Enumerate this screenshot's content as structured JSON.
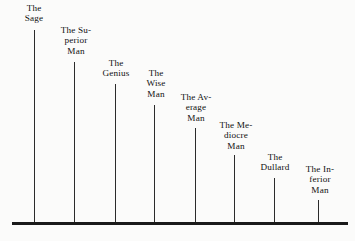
{
  "chart_data": {
    "type": "bar",
    "title": "",
    "subtitle": "",
    "xlabel": "",
    "ylabel": "",
    "grid": false,
    "legend": null,
    "axis": {
      "baseline_visible": true,
      "y_axis_visible": false,
      "tick_labels": [],
      "ylim": [
        0,
        100
      ]
    },
    "categories": [
      "The Sage",
      "The Superior Man",
      "The Genius",
      "The Wise Man",
      "The Average Man",
      "The Mediocre Man",
      "The Dullard",
      "The Inferior Man"
    ],
    "values": [
      100,
      84,
      72,
      61,
      49,
      35,
      23,
      12
    ],
    "annotations": []
  },
  "bars": [
    {
      "label_lines": [
        "The",
        "Sage"
      ],
      "name": "sage",
      "x": 34,
      "top": 30,
      "label_x": 34,
      "label_y": 3,
      "value": 100
    },
    {
      "label_lines": [
        "The Su-",
        "perior",
        "Man"
      ],
      "name": "superior-man",
      "x": 74,
      "top": 62,
      "label_x": 76,
      "label_y": 25,
      "value": 84
    },
    {
      "label_lines": [
        "The",
        "Genius"
      ],
      "name": "genius",
      "x": 115,
      "top": 84,
      "label_x": 116,
      "label_y": 58,
      "value": 72
    },
    {
      "label_lines": [
        "The",
        "Wise",
        "Man"
      ],
      "name": "wise-man",
      "x": 154,
      "top": 105,
      "label_x": 156,
      "label_y": 68,
      "value": 61
    },
    {
      "label_lines": [
        "The Av-",
        "erage",
        "Man"
      ],
      "name": "average-man",
      "x": 195,
      "top": 128,
      "label_x": 196,
      "label_y": 92,
      "value": 49
    },
    {
      "label_lines": [
        "The Me-",
        "diocre",
        "Man"
      ],
      "name": "mediocre-man",
      "x": 234,
      "top": 155,
      "label_x": 236,
      "label_y": 120,
      "value": 35
    },
    {
      "label_lines": [
        "The",
        "Dullard"
      ],
      "name": "dullard",
      "x": 274,
      "top": 178,
      "label_x": 275,
      "label_y": 152,
      "value": 23
    },
    {
      "label_lines": [
        "The In-",
        "ferior",
        "Man"
      ],
      "name": "inferior-man",
      "x": 318,
      "top": 200,
      "label_x": 320,
      "label_y": 164,
      "value": 12
    }
  ],
  "geometry": {
    "baseline_y": 222,
    "baseline_left": 12,
    "baseline_right": 348,
    "baseline_thickness": 3
  }
}
